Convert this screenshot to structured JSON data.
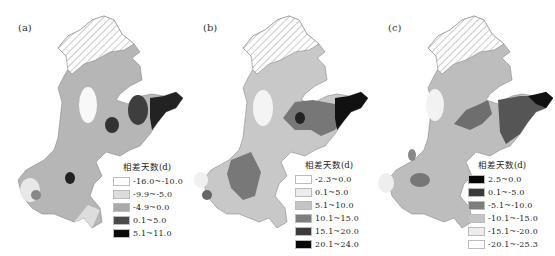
{
  "panels": [
    {
      "label": "(a)",
      "legend": {
        "title": "相差天数(d)",
        "items": [
          {
            "label": "-16.0~-10.0",
            "color": "#ffffff"
          },
          {
            "label": "-9.9~-5.0",
            "color": "#dcdcdc"
          },
          {
            "label": "-4.9~0.0",
            "color": "#a9a9a9"
          },
          {
            "label": "0.1~5.0",
            "color": "#4a4a4a"
          },
          {
            "label": "5.1~11.0",
            "color": "#0a0a0a"
          }
        ]
      }
    },
    {
      "label": "(b)",
      "legend": {
        "title": "相差天数(d)",
        "items": [
          {
            "label": "-2.3~0.0",
            "color": "#ffffff"
          },
          {
            "label": "0.1~5.0",
            "color": "#ececec"
          },
          {
            "label": "5.1~10.0",
            "color": "#c4c4c4"
          },
          {
            "label": "10.1~15.0",
            "color": "#7e7e7e"
          },
          {
            "label": "15.1~20.0",
            "color": "#3a3a3a"
          },
          {
            "label": "20.1~24.0",
            "color": "#080808"
          }
        ]
      }
    },
    {
      "label": "(c)",
      "legend": {
        "title": "相差天数(d)",
        "items": [
          {
            "label": "2.5~0.0",
            "color": "#080808"
          },
          {
            "label": "0.1~-5.0",
            "color": "#3a3a3a"
          },
          {
            "label": "-5.1~-10.0",
            "color": "#7e7e7e"
          },
          {
            "label": "-10.1~-15.0",
            "color": "#c4c4c4"
          },
          {
            "label": "-15.1~-20.0",
            "color": "#ececec"
          },
          {
            "label": "-20.1~-25.3",
            "color": "#ffffff"
          }
        ]
      }
    }
  ]
}
